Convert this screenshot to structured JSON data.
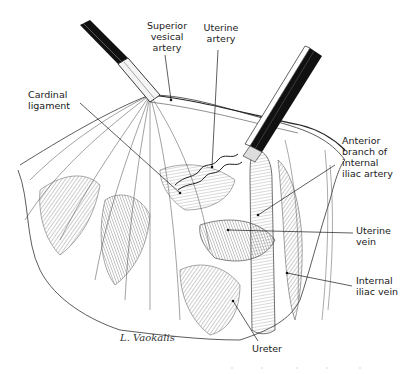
{
  "figure": {
    "labels": [
      {
        "id": "superior-vesical-artery",
        "text": "Superior\nvesical\nartery"
      },
      {
        "id": "uterine-artery",
        "text": "Uterine\nartery"
      },
      {
        "id": "cardinal-ligament",
        "text": "Cardinal\nligament"
      },
      {
        "id": "anterior-branch-internal-iliac-artery",
        "text": "Anterior\nbranch of\ninternal\niliac artery"
      },
      {
        "id": "uterine-vein",
        "text": "Uterine\nvein"
      },
      {
        "id": "internal-iliac-vein",
        "text": "Internal\niliac vein"
      },
      {
        "id": "ureter",
        "text": "Ureter"
      }
    ],
    "signature": "L. Vaokalis"
  }
}
